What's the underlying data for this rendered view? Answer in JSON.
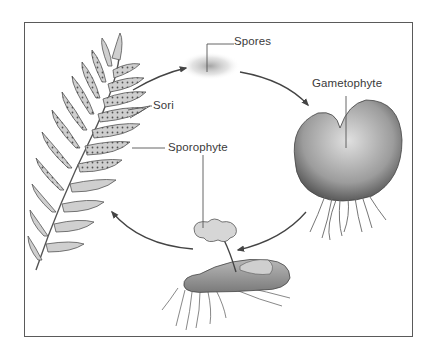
{
  "diagram": {
    "type": "life-cycle",
    "labels": {
      "spores": "Spores",
      "gametophyte": "Gametophyte",
      "sori": "Sori",
      "sporophyte": "Sporophyte"
    },
    "stages": [
      {
        "name": "Sporophyte",
        "part": "frond with sori"
      },
      {
        "name": "Spores"
      },
      {
        "name": "Gametophyte"
      },
      {
        "name": "Sporophyte",
        "part": "young sporophyte on gametophyte"
      }
    ],
    "colors": {
      "frame": "#5a5a5a",
      "ink": "#3a3a3a",
      "leaf_fill": "#c9c9c9",
      "arrow": "#444444"
    }
  }
}
